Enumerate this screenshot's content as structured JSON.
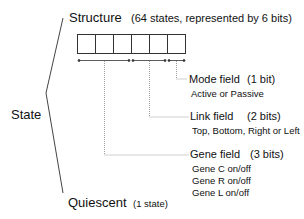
{
  "root": {
    "label": "State"
  },
  "structure": {
    "label": "Structure",
    "note": "(64 states, represented by 6 bits)",
    "bit_count": 6
  },
  "quiescent": {
    "label": "Quiescent",
    "note": "(1 state)"
  },
  "fields": [
    {
      "name": "Mode field",
      "bits": "(1 bit)",
      "details": [
        "Active or Passive"
      ]
    },
    {
      "name": "Link field",
      "bits": "(2 bits)",
      "details": [
        "Top, Bottom, Right or Left"
      ]
    },
    {
      "name": "Gene field",
      "bits": "(3 bits)",
      "details": [
        "Gene C on/off",
        "Gene R on/off",
        "Gene L on/off"
      ]
    }
  ],
  "colors": {
    "line": "#333333",
    "dotted": "#888888",
    "text": "#111111"
  }
}
